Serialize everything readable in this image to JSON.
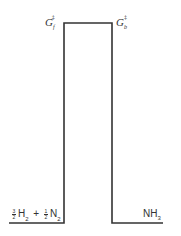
{
  "diagram": {
    "type": "free-energy-barrier",
    "labels": {
      "forward_barrier": {
        "symbol": "G",
        "subscript": "f",
        "superscript": "‡"
      },
      "backward_barrier": {
        "symbol": "G",
        "subscript": "b",
        "superscript": "‡"
      },
      "reactants": {
        "coef1_num": "3",
        "coef1_den": "2",
        "species1": "H",
        "species1_sub": "2",
        "plus": "+",
        "coef2_num": "1",
        "coef2_den": "2",
        "species2": "N",
        "species2_sub": "2"
      },
      "products": {
        "species": "NH",
        "species_sub": "3"
      }
    },
    "line_color": "#333333"
  }
}
